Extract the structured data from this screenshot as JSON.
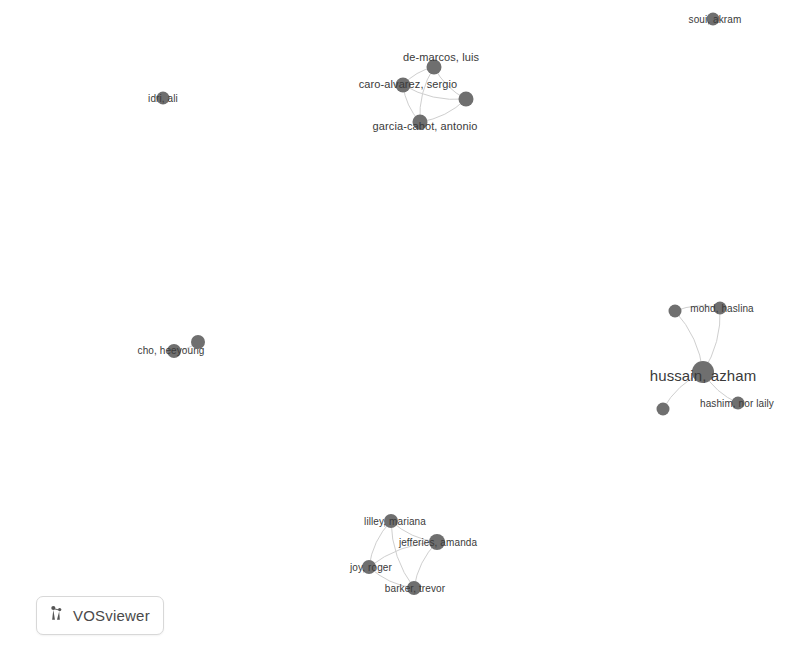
{
  "app": {
    "name": "VOSviewer",
    "badge_label": "VOSviewer",
    "badge_icon": "vosviewer-network-logo-icon",
    "background_color": "#ffffff",
    "node_color": "#6f6f6f",
    "label_color": "#3a3a3a",
    "edge_color": "#cfcfcf"
  },
  "visualization": {
    "type": "network-map",
    "width": 803,
    "height": 655,
    "description": "Co-authorship network visualization with six disconnected clusters of author nodes"
  },
  "network": {
    "nodes": [
      {
        "id": "de-marcos",
        "label": "de-marcos, luis",
        "x": 434,
        "y": 67,
        "r": 7.5,
        "label_x": 441,
        "label_y": 57,
        "font_size": 11,
        "cluster": "top-center"
      },
      {
        "id": "caro-alvarez",
        "label": "caro-alvarez, sergio",
        "x": 403,
        "y": 85,
        "r": 7.5,
        "label_x": 408,
        "label_y": 84,
        "font_size": 11,
        "cluster": "top-center"
      },
      {
        "id": "garcia-cabot",
        "label": "garcia-cabot, antonio",
        "x": 420,
        "y": 122,
        "r": 7.5,
        "label_x": 425,
        "label_y": 126,
        "font_size": 11,
        "cluster": "top-center"
      },
      {
        "id": "top-center-4",
        "label": "",
        "x": 466,
        "y": 99,
        "r": 7.5,
        "label_x": 466,
        "label_y": 99,
        "font_size": 11,
        "cluster": "top-center"
      },
      {
        "id": "hussain",
        "label": "hussain, azham",
        "x": 703,
        "y": 372,
        "r": 11,
        "label_x": 703,
        "label_y": 375,
        "font_size": 15,
        "cluster": "right"
      },
      {
        "id": "mohd",
        "label": "mohd, haslina",
        "x": 720,
        "y": 308,
        "r": 6.5,
        "label_x": 722,
        "label_y": 308,
        "font_size": 10,
        "cluster": "right"
      },
      {
        "id": "hashim",
        "label": "hashim, nor laily",
        "x": 738,
        "y": 403,
        "r": 6.5,
        "label_x": 737,
        "label_y": 403,
        "font_size": 10,
        "cluster": "right"
      },
      {
        "id": "right-small-1",
        "label": "",
        "x": 675,
        "y": 311,
        "r": 6.5,
        "label_x": 675,
        "label_y": 311,
        "font_size": 10,
        "cluster": "right"
      },
      {
        "id": "right-small-2",
        "label": "",
        "x": 663,
        "y": 409,
        "r": 6.5,
        "label_x": 663,
        "label_y": 409,
        "font_size": 10,
        "cluster": "right"
      },
      {
        "id": "lilley",
        "label": "lilley, mariana",
        "x": 391,
        "y": 521,
        "r": 7,
        "label_x": 395,
        "label_y": 521,
        "font_size": 10,
        "cluster": "bottom-center"
      },
      {
        "id": "jefferies",
        "label": "jefferies, amanda",
        "x": 437,
        "y": 542,
        "r": 8,
        "label_x": 438,
        "label_y": 542,
        "font_size": 10,
        "cluster": "bottom-center"
      },
      {
        "id": "joy",
        "label": "joy, roger",
        "x": 369,
        "y": 567,
        "r": 7,
        "label_x": 371,
        "label_y": 567,
        "font_size": 10,
        "cluster": "bottom-center"
      },
      {
        "id": "barker",
        "label": "barker, trevor",
        "x": 414,
        "y": 588,
        "r": 7,
        "label_x": 415,
        "label_y": 588,
        "font_size": 10,
        "cluster": "bottom-center"
      },
      {
        "id": "idri",
        "label": "idri, ali",
        "x": 163,
        "y": 98,
        "r": 6.5,
        "label_x": 163,
        "label_y": 98,
        "font_size": 10,
        "cluster": "left-isolated"
      },
      {
        "id": "cho",
        "label": "cho, heeyoung",
        "x": 174,
        "y": 351,
        "r": 7,
        "label_x": 171,
        "label_y": 350,
        "font_size": 10,
        "cluster": "left-pair"
      },
      {
        "id": "cho-pair",
        "label": "",
        "x": 198,
        "y": 342,
        "r": 7,
        "label_x": 198,
        "label_y": 342,
        "font_size": 10,
        "cluster": "left-pair"
      },
      {
        "id": "soui",
        "label": "soui, akram",
        "x": 713,
        "y": 19,
        "r": 6.5,
        "label_x": 715,
        "label_y": 19,
        "font_size": 10,
        "cluster": "top-right-isolated"
      }
    ],
    "edges": [
      {
        "source": "de-marcos",
        "target": "caro-alvarez"
      },
      {
        "source": "de-marcos",
        "target": "garcia-cabot"
      },
      {
        "source": "de-marcos",
        "target": "top-center-4"
      },
      {
        "source": "caro-alvarez",
        "target": "garcia-cabot"
      },
      {
        "source": "caro-alvarez",
        "target": "top-center-4"
      },
      {
        "source": "garcia-cabot",
        "target": "top-center-4"
      },
      {
        "source": "hussain",
        "target": "mohd"
      },
      {
        "source": "hussain",
        "target": "hashim"
      },
      {
        "source": "hussain",
        "target": "right-small-1"
      },
      {
        "source": "hussain",
        "target": "right-small-2"
      },
      {
        "source": "mohd",
        "target": "right-small-1"
      },
      {
        "source": "lilley",
        "target": "jefferies"
      },
      {
        "source": "lilley",
        "target": "joy"
      },
      {
        "source": "lilley",
        "target": "barker"
      },
      {
        "source": "jefferies",
        "target": "joy"
      },
      {
        "source": "jefferies",
        "target": "barker"
      },
      {
        "source": "joy",
        "target": "barker"
      },
      {
        "source": "cho",
        "target": "cho-pair"
      }
    ]
  }
}
